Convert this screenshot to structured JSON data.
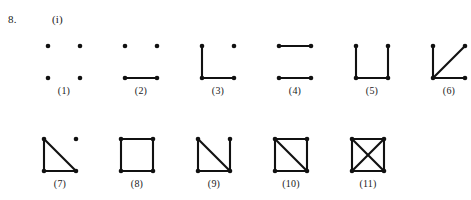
{
  "problem": {
    "number": "8.",
    "part": "(i)"
  },
  "layout": {
    "vertex_radius": 2.3,
    "cell_width": 32,
    "cell_height": 32,
    "top_row_gap": 33,
    "bottom_row_gap": 33
  },
  "colors": {
    "ink": "#111111",
    "page_background": "#ffffff",
    "text": "#1a1a1a"
  },
  "figures": {
    "vertex_positions": {
      "tl": [
        0,
        0
      ],
      "tr": [
        1,
        0
      ],
      "bl": [
        0,
        1
      ],
      "br": [
        1,
        1
      ]
    },
    "rows": [
      {
        "name": "top-row",
        "items": [
          {
            "caption": "(1)",
            "description": "four isolated vertices, no edges",
            "vertices": [
              "tl",
              "tr",
              "bl",
              "br"
            ],
            "edges": []
          },
          {
            "caption": "(2)",
            "description": "single edge along the bottom",
            "vertices": [
              "tl",
              "tr",
              "bl",
              "br"
            ],
            "edges": [
              [
                "bl",
                "br"
              ]
            ]
          },
          {
            "caption": "(3)",
            "description": "left side and bottom edges, path of length two",
            "vertices": [
              "tl",
              "tr",
              "bl",
              "br"
            ],
            "edges": [
              [
                "tl",
                "bl"
              ],
              [
                "bl",
                "br"
              ]
            ]
          },
          {
            "caption": "(4)",
            "description": "two parallel edges, top and bottom",
            "vertices": [
              "tl",
              "tr",
              "bl",
              "br"
            ],
            "edges": [
              [
                "tl",
                "tr"
              ],
              [
                "bl",
                "br"
              ]
            ]
          },
          {
            "caption": "(5)",
            "description": "U shape, left side bottom and right side",
            "vertices": [
              "tl",
              "tr",
              "bl",
              "br"
            ],
            "edges": [
              [
                "tl",
                "bl"
              ],
              [
                "bl",
                "br"
              ],
              [
                "br",
                "tr"
              ]
            ]
          },
          {
            "caption": "(6)",
            "description": "star centred at the bottom left vertex",
            "vertices": [
              "tl",
              "tr",
              "bl",
              "br"
            ],
            "edges": [
              [
                "bl",
                "tl"
              ],
              [
                "bl",
                "tr"
              ],
              [
                "bl",
                "br"
              ]
            ]
          }
        ]
      },
      {
        "name": "bottom-row",
        "items": [
          {
            "caption": "(7)",
            "description": "triangle with one isolated vertex at the top right",
            "vertices": [
              "tl",
              "tr",
              "bl",
              "br"
            ],
            "edges": [
              [
                "tl",
                "bl"
              ],
              [
                "tl",
                "br"
              ],
              [
                "bl",
                "br"
              ]
            ]
          },
          {
            "caption": "(8)",
            "description": "four cycle, square with no diagonals",
            "vertices": [
              "tl",
              "tr",
              "bl",
              "br"
            ],
            "edges": [
              [
                "tl",
                "tr"
              ],
              [
                "tr",
                "br"
              ],
              [
                "br",
                "bl"
              ],
              [
                "bl",
                "tl"
              ]
            ]
          },
          {
            "caption": "(9)",
            "description": "square missing the top edge plus one diagonal",
            "vertices": [
              "tl",
              "tr",
              "bl",
              "br"
            ],
            "edges": [
              [
                "tl",
                "bl"
              ],
              [
                "tl",
                "br"
              ],
              [
                "tr",
                "br"
              ],
              [
                "bl",
                "br"
              ]
            ]
          },
          {
            "caption": "(10)",
            "description": "four cycle plus one diagonal",
            "vertices": [
              "tl",
              "tr",
              "bl",
              "br"
            ],
            "edges": [
              [
                "tl",
                "tr"
              ],
              [
                "tr",
                "br"
              ],
              [
                "br",
                "bl"
              ],
              [
                "bl",
                "tl"
              ],
              [
                "tl",
                "br"
              ]
            ]
          },
          {
            "caption": "(11)",
            "description": "complete graph on four vertices, square with both diagonals",
            "vertices": [
              "tl",
              "tr",
              "bl",
              "br"
            ],
            "edges": [
              [
                "tl",
                "tr"
              ],
              [
                "tr",
                "br"
              ],
              [
                "br",
                "bl"
              ],
              [
                "bl",
                "tl"
              ],
              [
                "tl",
                "br"
              ],
              [
                "tr",
                "bl"
              ]
            ]
          }
        ]
      }
    ]
  }
}
